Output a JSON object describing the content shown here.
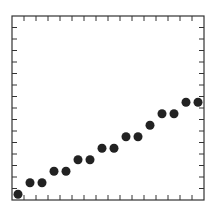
{
  "chart_data": {
    "type": "scatter",
    "title": "",
    "xlabel": "",
    "ylabel": "",
    "x": [
      0.5,
      1.5,
      2.5,
      3.5,
      4.5,
      5.5,
      6.5,
      7.5,
      8.5,
      9.5,
      10.5,
      11.5,
      12.5,
      13.5,
      14.5,
      15.5
    ],
    "y": [
      0.5,
      1.5,
      1.5,
      2.5,
      2.5,
      3.5,
      3.5,
      4.5,
      4.5,
      5.5,
      5.5,
      6.5,
      7.5,
      7.5,
      8.5,
      8.5
    ],
    "xlim": [
      0,
      16
    ],
    "ylim": [
      0,
      16
    ],
    "x_ticks": 16,
    "y_ticks": 16,
    "tick_labels": false,
    "grid": false,
    "legend": null,
    "marker_color": "#222222",
    "frame_color": "#333333"
  }
}
